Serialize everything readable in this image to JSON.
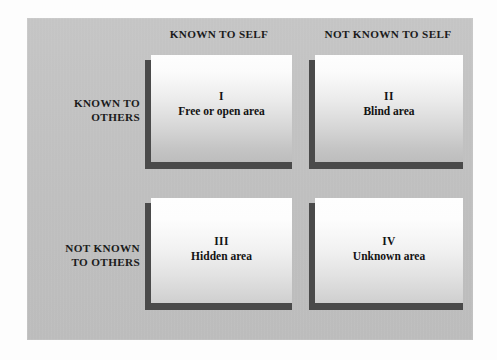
{
  "figure": {
    "panel_color": "#c2c2c2",
    "card_shadow_color": "#4a4a4a",
    "text_color": "#121212"
  },
  "column_headers": [
    {
      "label": "KNOWN TO SELF"
    },
    {
      "label": "NOT KNOWN TO SELF"
    }
  ],
  "row_headers": [
    {
      "line1": "KNOWN TO",
      "line2": "OTHERS"
    },
    {
      "line1": "NOT KNOWN",
      "line2": "TO OTHERS"
    }
  ],
  "quadrants": [
    {
      "numeral": "I",
      "caption": "Free or open area"
    },
    {
      "numeral": "II",
      "caption": "Blind area"
    },
    {
      "numeral": "III",
      "caption": "Hidden area"
    },
    {
      "numeral": "IV",
      "caption": "Unknown area"
    }
  ]
}
